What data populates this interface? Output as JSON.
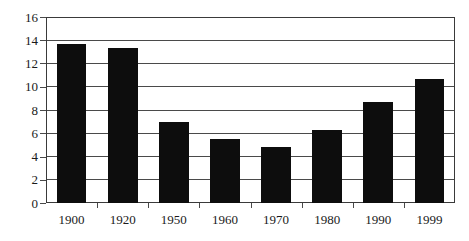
{
  "chart_data": {
    "type": "bar",
    "title": "",
    "subtitle": "",
    "xlabel": "",
    "ylabel": "",
    "categories": [
      "1900",
      "1920",
      "1950",
      "1960",
      "1970",
      "1980",
      "1990",
      "1999"
    ],
    "values": [
      13.7,
      13.3,
      7.0,
      5.5,
      4.8,
      6.3,
      8.7,
      10.7
    ],
    "series": [
      {
        "name": "",
        "values": [
          13.7,
          13.3,
          7.0,
          5.5,
          4.8,
          6.3,
          8.7,
          10.7
        ]
      }
    ],
    "ylim": [
      0,
      16
    ],
    "yticks": [
      0,
      2,
      4,
      6,
      8,
      10,
      12,
      14,
      16
    ],
    "ytick_labels": [
      "0",
      "2",
      "4",
      "6",
      "8",
      "10",
      "12",
      "14",
      "16"
    ],
    "xtick_labels": [
      "1900",
      "1920",
      "1950",
      "1960",
      "1970",
      "1980",
      "1990",
      "1999"
    ],
    "grid": true,
    "grid_axis": "y",
    "legend": false,
    "legend_position": "none",
    "annotations": [],
    "colors": {
      "bar_fill": "#0d0d0d",
      "gridline": "#4a4a4a",
      "axis": "#3a3a3a",
      "background": "#ffffff",
      "text": "#1a1a1a"
    }
  }
}
